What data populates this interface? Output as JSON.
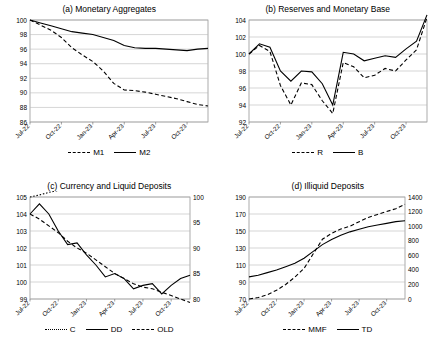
{
  "chart_data": [
    {
      "type": "line",
      "title": "(a) Monetary Aggregates",
      "xlabel": "",
      "ylabel": "",
      "x": [
        "Jul-22",
        "Aug-22",
        "Sep-22",
        "Oct-22",
        "Nov-22",
        "Dec-22",
        "Jan-23",
        "Feb-23",
        "Mar-23",
        "Apr-23",
        "May-23",
        "Jun-23",
        "Jul-23",
        "Aug-23",
        "Sep-23",
        "Oct-23",
        "Nov-23",
        "Dec-23"
      ],
      "xticklabels": [
        "Jul-22",
        "Oct-22",
        "Jan-23",
        "Apr-23",
        "Jul-23",
        "Oct-23"
      ],
      "yticklabels": [
        "86",
        "88",
        "90",
        "92",
        "94",
        "96",
        "98",
        "100"
      ],
      "ylim": [
        86,
        100
      ],
      "grid": true,
      "legend_position": "bottom",
      "series": [
        {
          "name": "M1",
          "style": "dashed",
          "values": [
            100,
            99.3,
            98.6,
            97.6,
            96.2,
            95.2,
            94.3,
            93.0,
            91.3,
            90.4,
            90.3,
            90.1,
            89.8,
            89.5,
            89.2,
            88.8,
            88.4,
            88.2
          ]
        },
        {
          "name": "M2",
          "style": "solid",
          "values": [
            100,
            99.6,
            99.2,
            98.8,
            98.4,
            98.2,
            98.0,
            97.6,
            97.2,
            96.5,
            96.2,
            96.1,
            96.1,
            96.0,
            95.9,
            95.8,
            96.0,
            96.1
          ]
        }
      ]
    },
    {
      "type": "line",
      "title": "(b) Reserves and Monetary Base",
      "xlabel": "",
      "ylabel": "",
      "x": [
        "Jul-22",
        "Aug-22",
        "Sep-22",
        "Oct-22",
        "Nov-22",
        "Dec-22",
        "Jan-23",
        "Feb-23",
        "Mar-23",
        "Apr-23",
        "May-23",
        "Jun-23",
        "Jul-23",
        "Aug-23",
        "Sep-23",
        "Oct-23",
        "Nov-23",
        "Dec-23"
      ],
      "xticklabels": [
        "Jul-22",
        "Oct-22",
        "Jan-23",
        "Apr-23",
        "Jul-23",
        "Oct-23"
      ],
      "yticklabels": [
        "92",
        "94",
        "96",
        "98",
        "100",
        "102",
        "104"
      ],
      "ylim": [
        92,
        104
      ],
      "grid": true,
      "legend_position": "bottom",
      "series": [
        {
          "name": "R",
          "style": "dashed",
          "values": [
            100,
            101.0,
            100.3,
            96.3,
            94.0,
            96.6,
            96.4,
            94.5,
            93.0,
            99.0,
            98.5,
            97.2,
            97.5,
            98.3,
            98.0,
            99.3,
            100.5,
            104.3
          ]
        },
        {
          "name": "B",
          "style": "solid",
          "values": [
            100,
            101.2,
            100.8,
            98.0,
            96.8,
            98.0,
            97.9,
            96.5,
            94.0,
            100.2,
            100.0,
            99.2,
            99.5,
            99.8,
            99.6,
            100.6,
            101.5,
            104.6
          ]
        }
      ]
    },
    {
      "type": "line",
      "title": "(c) Currency and Liquid Deposits",
      "xlabel": "",
      "ylabel": "",
      "x": [
        "Jul-22",
        "Aug-22",
        "Sep-22",
        "Oct-22",
        "Nov-22",
        "Dec-22",
        "Jan-23",
        "Feb-23",
        "Mar-23",
        "Apr-23",
        "May-23",
        "Jun-23",
        "Jul-23",
        "Aug-23",
        "Sep-23",
        "Oct-23",
        "Nov-23",
        "Dec-23"
      ],
      "xticklabels": [
        "Jul-22",
        "Oct-22",
        "Jan-23",
        "Apr-23",
        "Jul-23",
        "Oct-23"
      ],
      "yticklabels": [
        "99",
        "100",
        "101",
        "102",
        "103",
        "104",
        "105"
      ],
      "ylim": [
        99,
        105
      ],
      "y2ticklabels": [
        "80",
        "85",
        "90",
        "95",
        "100"
      ],
      "y2lim": [
        80,
        100
      ],
      "grid": true,
      "legend_position": "bottom",
      "series": [
        {
          "name": "C",
          "style": "dotted",
          "axis": "right",
          "values": [
            100.0,
            100.4,
            100.9,
            101.3,
            101.6,
            101.9,
            102.2,
            102.3,
            102.5,
            102.6,
            102.7,
            102.8,
            102.9,
            103.0,
            103.0,
            103.0,
            103.0,
            103.0
          ]
        },
        {
          "name": "DD",
          "style": "solid",
          "axis": "left",
          "values": [
            104.0,
            104.6,
            104.0,
            103.0,
            102.2,
            102.3,
            101.6,
            101.0,
            100.3,
            100.5,
            100.2,
            99.6,
            99.8,
            99.9,
            99.3,
            99.8,
            100.2,
            100.4
          ]
        },
        {
          "name": "OLD",
          "style": "dashed",
          "axis": "left",
          "values": [
            104.0,
            103.7,
            103.3,
            102.9,
            102.4,
            102.0,
            101.7,
            101.3,
            100.9,
            100.5,
            100.2,
            99.9,
            99.7,
            99.6,
            99.4,
            99.2,
            99.0,
            98.8
          ]
        }
      ]
    },
    {
      "type": "line",
      "title": "(d) Illiquid Deposits",
      "xlabel": "",
      "ylabel": "",
      "x": [
        "Jul-22",
        "Aug-22",
        "Sep-22",
        "Oct-22",
        "Nov-22",
        "Dec-22",
        "Jan-23",
        "Feb-23",
        "Mar-23",
        "Apr-23",
        "May-23",
        "Jun-23",
        "Jul-23",
        "Aug-23",
        "Sep-23",
        "Oct-23",
        "Nov-23",
        "Dec-23"
      ],
      "xticklabels": [
        "Jul-22",
        "Oct-22",
        "Jan-23",
        "Apr-23",
        "Jul-23",
        "Oct-23"
      ],
      "yticklabels": [
        "70",
        "90",
        "110",
        "130",
        "150",
        "170",
        "190"
      ],
      "ylim": [
        70,
        190
      ],
      "y2ticklabels": [
        "0",
        "200",
        "400",
        "600",
        "800",
        "1000",
        "1200",
        "1400"
      ],
      "y2lim": [
        0,
        1400
      ],
      "grid": true,
      "legend_position": "bottom",
      "series": [
        {
          "name": "MMF",
          "style": "dashed",
          "axis": "right",
          "values": [
            0,
            20,
            60,
            120,
            200,
            300,
            420,
            620,
            820,
            900,
            960,
            1000,
            1060,
            1120,
            1160,
            1200,
            1240,
            1300
          ]
        },
        {
          "name": "TD",
          "style": "solid",
          "axis": "left",
          "values": [
            96,
            98,
            101,
            104,
            108,
            112,
            118,
            126,
            134,
            140,
            145,
            149,
            152,
            155,
            157,
            159,
            161,
            162
          ]
        }
      ]
    }
  ]
}
